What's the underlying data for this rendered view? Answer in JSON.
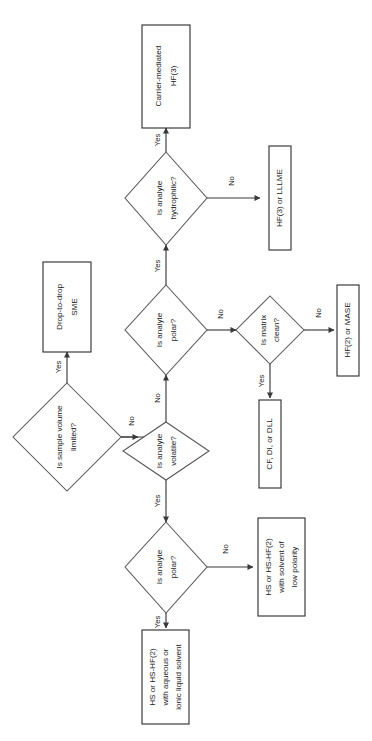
{
  "diagram": {
    "orientation": "rotated-90-ccw",
    "background_color": "#ffffff",
    "line_color": "#3a3a3a",
    "text_color": "#1a1a1a",
    "nodes": [
      {
        "id": "q_sample_volume",
        "type": "decision",
        "lines": [
          "Is sample volume",
          "limited?"
        ]
      },
      {
        "id": "t_drop_to_drop",
        "type": "terminal",
        "lines": [
          "Drop-to-drop",
          "SME"
        ]
      },
      {
        "id": "q_volatile",
        "type": "decision",
        "lines": [
          "Is analyte",
          "volatile?"
        ]
      },
      {
        "id": "q_polar_upper",
        "type": "decision",
        "lines": [
          "Is analyte",
          "polar?"
        ]
      },
      {
        "id": "q_hydrophilic",
        "type": "decision",
        "lines": [
          "Is analyte",
          "hydrophilic?"
        ]
      },
      {
        "id": "t_carrier_mediated",
        "type": "terminal",
        "lines": [
          "Carrier-mediated",
          "HF(3)"
        ]
      },
      {
        "id": "t_hf3_lllme",
        "type": "terminal",
        "lines": [
          "HF(3) or LLLME"
        ]
      },
      {
        "id": "q_matrix_clean",
        "type": "decision",
        "lines": [
          "Is matrix",
          "clean?"
        ]
      },
      {
        "id": "t_cf_di_dll",
        "type": "terminal",
        "lines": [
          "CF, DI, or DLL"
        ]
      },
      {
        "id": "t_hf2_mase",
        "type": "terminal",
        "lines": [
          "HF(2) or MASE"
        ]
      },
      {
        "id": "q_polar_lower",
        "type": "decision",
        "lines": [
          "Is analyte",
          "polar?"
        ]
      },
      {
        "id": "t_hs_low_polarity",
        "type": "terminal",
        "lines": [
          "HS or HS-HF(2)",
          "with solvent of",
          "low polarity"
        ]
      },
      {
        "id": "t_hs_aqueous",
        "type": "terminal",
        "lines": [
          "HS or HS-HF(2)",
          "with aqueous or",
          "ionic liquid solvent"
        ]
      }
    ],
    "edges": [
      {
        "id": "e_vol_yes",
        "from": "q_sample_volume",
        "to": "t_drop_to_drop",
        "label": "Yes"
      },
      {
        "id": "e_vol_no",
        "from": "q_sample_volume",
        "to": "q_volatile",
        "label": "No"
      },
      {
        "id": "e_volatile_no",
        "from": "q_volatile",
        "to": "q_polar_upper",
        "label": "No"
      },
      {
        "id": "e_volatile_yes",
        "from": "q_volatile",
        "to": "q_polar_lower",
        "label": "Yes"
      },
      {
        "id": "e_polarup_yes",
        "from": "q_polar_upper",
        "to": "q_hydrophilic",
        "label": "Yes"
      },
      {
        "id": "e_polarup_no",
        "from": "q_polar_upper",
        "to": "q_matrix_clean",
        "label": "No"
      },
      {
        "id": "e_hydro_yes",
        "from": "q_hydrophilic",
        "to": "t_carrier_mediated",
        "label": "Yes"
      },
      {
        "id": "e_hydro_no",
        "from": "q_hydrophilic",
        "to": "t_hf3_lllme",
        "label": "No"
      },
      {
        "id": "e_matrix_yes",
        "from": "q_matrix_clean",
        "to": "t_cf_di_dll",
        "label": "Yes"
      },
      {
        "id": "e_matrix_no",
        "from": "q_matrix_clean",
        "to": "t_hf2_mase",
        "label": "No"
      },
      {
        "id": "e_polarlow_yes",
        "from": "q_polar_lower",
        "to": "t_hs_aqueous",
        "label": "Yes"
      },
      {
        "id": "e_polarlow_no",
        "from": "q_polar_lower",
        "to": "t_hs_low_polarity",
        "label": "No"
      }
    ]
  }
}
